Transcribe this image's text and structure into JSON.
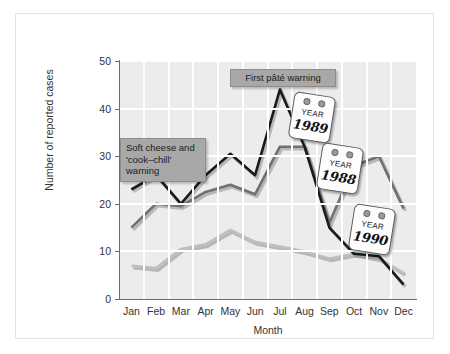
{
  "chart_data": {
    "type": "line",
    "title": "",
    "xlabel": "Month",
    "ylabel": "Number of reported cases",
    "categories": [
      "Jan",
      "Feb",
      "Mar",
      "Apr",
      "May",
      "Jun",
      "Jul",
      "Aug",
      "Sep",
      "Oct",
      "Nov",
      "Dec"
    ],
    "ylim": [
      0,
      50
    ],
    "yticks": [
      0,
      10,
      20,
      30,
      40,
      50
    ],
    "grid": true,
    "legend_position": "none (series labelled by year tags)",
    "series": [
      {
        "name": "1990",
        "color": "#1a1a1a",
        "values": [
          23,
          26,
          20,
          26,
          30.5,
          26,
          44,
          32,
          15,
          9.5,
          9,
          3
        ]
      },
      {
        "name": "1989",
        "color": "#707070",
        "values": [
          15,
          20,
          19.5,
          22.5,
          24,
          22,
          32,
          32,
          16,
          28,
          30,
          19
        ]
      },
      {
        "name": "1988",
        "color": "#bfbfbf",
        "values": [
          7,
          6.5,
          10.5,
          11.5,
          14.5,
          12,
          11,
          10,
          8.5,
          9.5,
          8.5,
          5.5
        ]
      }
    ],
    "annotations": [
      {
        "name": "soft-cheese-warning",
        "lines": [
          "Soft cheese and",
          "'cook–chill'",
          "warning"
        ],
        "anchor_month": "Feb"
      },
      {
        "name": "first-pate-warning",
        "lines": [
          "First pâté warning"
        ],
        "anchor_month": "Jul"
      }
    ],
    "year_tags": [
      {
        "label": "YEAR",
        "year": "1989",
        "series": "1990"
      },
      {
        "label": "YEAR",
        "year": "1988",
        "series": "1989"
      },
      {
        "label": "YEAR",
        "year": "1990",
        "series": "1988"
      }
    ]
  },
  "axes": {
    "y_title": "Number of reported cases",
    "x_title": "Month",
    "y_ticks": [
      "0",
      "10",
      "20",
      "30",
      "40",
      "50"
    ],
    "x_ticks": [
      "Jan",
      "Feb",
      "Mar",
      "Apr",
      "May",
      "Jun",
      "Jul",
      "Aug",
      "Sep",
      "Oct",
      "Nov",
      "Dec"
    ]
  },
  "callouts": {
    "cheese_l1": "Soft cheese and",
    "cheese_l2": "'cook–chill'",
    "cheese_l3": "warning",
    "pate": "First pâté warning"
  },
  "tags": {
    "t1": {
      "label": "YEAR",
      "year": "1989"
    },
    "t2": {
      "label": "YEAR",
      "year": "1988"
    },
    "t3": {
      "label": "YEAR",
      "year": "1990"
    }
  },
  "colors": {
    "plot_bg": "#ececec",
    "grid": "#ffffff",
    "series_1990": "#1a1a1a",
    "series_1989": "#707070",
    "series_1988": "#bfbfbf",
    "callout_bg": "#a8a8a8"
  }
}
